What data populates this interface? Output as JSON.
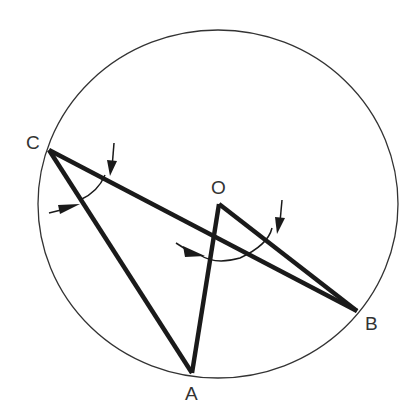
{
  "diagram": {
    "circle": {
      "cx": 218,
      "cy": 204,
      "rx": 180,
      "ry": 174,
      "stroke": "#333333"
    },
    "points": {
      "A": {
        "label": "A",
        "x": 192,
        "y": 373,
        "label_x": 192,
        "label_y": 399
      },
      "B": {
        "label": "B",
        "x": 357,
        "y": 311,
        "label_x": 373,
        "label_y": 328
      },
      "C": {
        "label": "C",
        "x": 49,
        "y": 150,
        "label_x": 34,
        "label_y": 149
      },
      "O": {
        "label": "O",
        "x": 219,
        "y": 204,
        "label_x": 219,
        "label_y": 193
      }
    },
    "segments": [
      {
        "from": "C",
        "to": "A"
      },
      {
        "from": "C",
        "to": "B"
      },
      {
        "from": "O",
        "to": "A"
      },
      {
        "from": "O",
        "to": "B"
      }
    ],
    "angle_marks": [
      {
        "vertex": "C",
        "name": "angle ACB"
      },
      {
        "vertex": "O",
        "name": "angle AOB"
      }
    ],
    "line_color": "#1a1a1a"
  }
}
